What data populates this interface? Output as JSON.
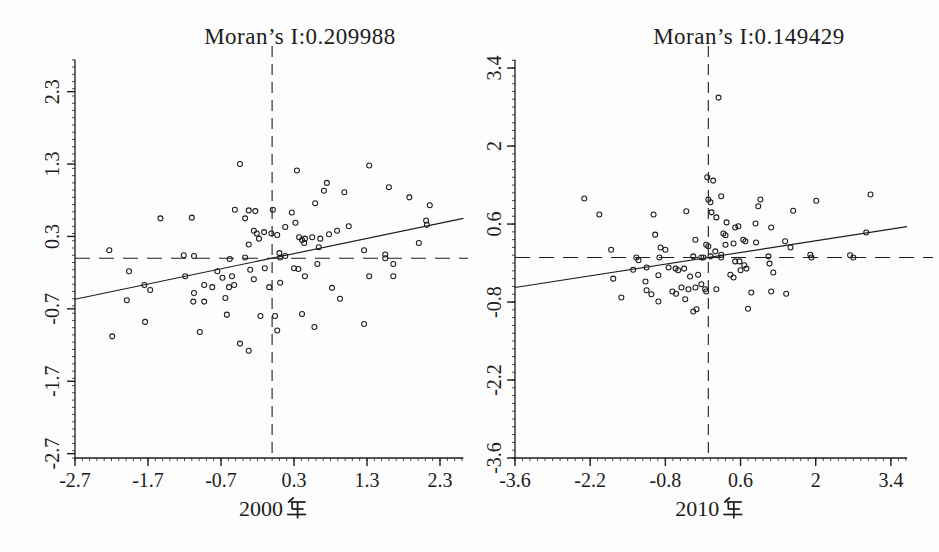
{
  "figure": {
    "background": "#fdfdfd",
    "ink_color": "#1c1c1c"
  },
  "chart_data": [
    {
      "type": "scatter",
      "title": "Moran’s I:0.209988",
      "moran_i": "0.209988",
      "xlabel": "2000年",
      "xlabel_year": "2000",
      "ylabel": "",
      "xlim": [
        -2.7,
        2.62
      ],
      "ylim": [
        -2.76,
        2.74
      ],
      "xticks": [
        -2.7,
        -1.7,
        -0.7,
        0.3,
        1.3,
        2.3
      ],
      "xtick_labels": [
        "-2.7",
        "-1.7",
        "-0.7",
        "0.3",
        "1.3",
        "2.3"
      ],
      "yticks": [
        -2.7,
        -1.7,
        -0.7,
        0.3,
        1.3,
        2.3
      ],
      "ytick_labels": [
        "-2.7",
        "-1.7",
        "-0.7",
        "0.3",
        "1.3",
        "2.3"
      ],
      "grid": false,
      "legend": "none",
      "crosshair": {
        "x": 0,
        "y": 0,
        "style": "dashed"
      },
      "regression": {
        "slope": 0.209988,
        "intercept": 0
      },
      "marker": {
        "shape": "open-circle",
        "radius": 2.5
      },
      "points": [
        [
          -0.44,
          1.3
        ],
        [
          -1.53,
          0.55
        ],
        [
          -1.1,
          0.56
        ],
        [
          -0.51,
          0.67
        ],
        [
          -0.32,
          0.66
        ],
        [
          -0.23,
          0.65
        ],
        [
          -0.37,
          0.55
        ],
        [
          -2.23,
          0.11
        ],
        [
          -1.21,
          0.04
        ],
        [
          -1.07,
          0.03
        ],
        [
          -0.25,
          0.38
        ],
        [
          -0.21,
          0.34
        ],
        [
          -0.18,
          0.27
        ],
        [
          -0.11,
          0.36
        ],
        [
          -0.01,
          0.34
        ],
        [
          -0.32,
          0.19
        ],
        [
          0.01,
          0.67
        ],
        [
          0.34,
          1.21
        ],
        [
          1.33,
          1.28
        ],
        [
          0.75,
          1.04
        ],
        [
          0.71,
          0.93
        ],
        [
          1.6,
          0.98
        ],
        [
          1.88,
          0.84
        ],
        [
          0.99,
          0.91
        ],
        [
          0.59,
          0.76
        ],
        [
          2.16,
          0.73
        ],
        [
          0.27,
          0.63
        ],
        [
          0.32,
          0.49
        ],
        [
          0.18,
          0.43
        ],
        [
          1.05,
          0.44
        ],
        [
          2.11,
          0.52
        ],
        [
          2.12,
          0.46
        ],
        [
          0.07,
          0.32
        ],
        [
          0.37,
          0.29
        ],
        [
          0.41,
          0.25
        ],
        [
          0.45,
          0.27
        ],
        [
          0.55,
          0.29
        ],
        [
          0.78,
          0.33
        ],
        [
          0.89,
          0.38
        ],
        [
          0.66,
          0.27
        ],
        [
          0.44,
          0.21
        ],
        [
          0.64,
          0.15
        ],
        [
          1.26,
          0.11
        ],
        [
          1.55,
          0.05
        ],
        [
          2.01,
          0.21
        ],
        [
          0.1,
          0.07
        ],
        [
          -1.96,
          -0.18
        ],
        [
          -1.75,
          -0.37
        ],
        [
          -1.67,
          -0.44
        ],
        [
          -1.99,
          -0.58
        ],
        [
          -1.19,
          -0.25
        ],
        [
          -1.07,
          -0.48
        ],
        [
          -0.93,
          -0.37
        ],
        [
          -1.08,
          -0.6
        ],
        [
          -0.93,
          -0.6
        ],
        [
          -0.82,
          -0.4
        ],
        [
          -0.75,
          -0.18
        ],
        [
          -0.68,
          -0.27
        ],
        [
          -0.64,
          -0.55
        ],
        [
          -0.59,
          -0.4
        ],
        [
          -0.55,
          -0.25
        ],
        [
          -0.52,
          -0.37
        ],
        [
          -0.3,
          -0.16
        ],
        [
          -0.25,
          -0.29
        ],
        [
          -0.1,
          -0.14
        ],
        [
          -0.04,
          -0.4
        ],
        [
          -0.62,
          -0.78
        ],
        [
          -0.16,
          -0.8
        ],
        [
          -1.74,
          -0.88
        ],
        [
          -0.99,
          -1.02
        ],
        [
          -2.19,
          -1.08
        ],
        [
          -0.44,
          -1.18
        ],
        [
          -0.32,
          -1.28
        ],
        [
          -0.58,
          -0.01
        ],
        [
          -0.37,
          0.01
        ],
        [
          0.3,
          -0.14
        ],
        [
          0.36,
          -0.15
        ],
        [
          0.45,
          -0.25
        ],
        [
          0.11,
          -0.34
        ],
        [
          0.62,
          -0.08
        ],
        [
          1.55,
          0.0
        ],
        [
          1.66,
          -0.08
        ],
        [
          1.66,
          -0.25
        ],
        [
          1.33,
          -0.25
        ],
        [
          0.82,
          -0.41
        ],
        [
          0.93,
          -0.56
        ],
        [
          0.04,
          -0.8
        ],
        [
          0.41,
          -0.77
        ],
        [
          0.58,
          -0.95
        ],
        [
          0.07,
          -1.0
        ],
        [
          1.26,
          -0.91
        ],
        [
          0.11,
          0.01
        ],
        [
          0.18,
          0.03
        ]
      ]
    },
    {
      "type": "scatter",
      "title": "Moran’s I:0.149429",
      "moran_i": "0.149429",
      "xlabel": "2010年",
      "xlabel_year": "2010",
      "ylabel": "",
      "xlim": [
        -3.6,
        3.7
      ],
      "ylim": [
        -3.6,
        3.55
      ],
      "xticks": [
        -3.6,
        -2.2,
        -0.8,
        0.6,
        2,
        3.4
      ],
      "xtick_labels": [
        "-3.6",
        "-2.2",
        "-0.8",
        "0.6",
        "2",
        "3.4"
      ],
      "yticks": [
        -3.6,
        -2.2,
        -0.8,
        0.6,
        2,
        3.4
      ],
      "ytick_labels": [
        "-3.6",
        "-2.2",
        "-0.8",
        "0.6",
        "2",
        "3.4"
      ],
      "grid": false,
      "legend": "none",
      "crosshair": {
        "x": 0,
        "y": 0,
        "style": "dashed"
      },
      "regression": {
        "slope": 0.149429,
        "intercept": 0
      },
      "marker": {
        "shape": "open-circle",
        "radius": 2.5
      },
      "points": [
        [
          -2.31,
          1.06
        ],
        [
          -2.03,
          0.77
        ],
        [
          -1.02,
          0.77
        ],
        [
          -0.41,
          0.83
        ],
        [
          0.0,
          1.04
        ],
        [
          -0.99,
          0.41
        ],
        [
          -1.81,
          0.14
        ],
        [
          -0.89,
          0.18
        ],
        [
          -0.8,
          0.14
        ],
        [
          -0.24,
          0.32
        ],
        [
          -0.04,
          0.23
        ],
        [
          0.04,
          0.99
        ],
        [
          -0.02,
          1.44
        ],
        [
          0.19,
          2.87
        ],
        [
          0.09,
          1.38
        ],
        [
          0.24,
          1.1
        ],
        [
          0.97,
          1.04
        ],
        [
          0.93,
          0.92
        ],
        [
          2.01,
          1.02
        ],
        [
          3.02,
          1.13
        ],
        [
          1.58,
          0.84
        ],
        [
          0.06,
          0.81
        ],
        [
          0.15,
          0.72
        ],
        [
          0.34,
          0.63
        ],
        [
          0.5,
          0.54
        ],
        [
          0.56,
          0.56
        ],
        [
          0.88,
          0.61
        ],
        [
          1.17,
          0.54
        ],
        [
          0.28,
          0.43
        ],
        [
          0.32,
          0.4
        ],
        [
          0.65,
          0.32
        ],
        [
          0.69,
          0.29
        ],
        [
          0.32,
          0.23
        ],
        [
          0.47,
          0.25
        ],
        [
          0.89,
          0.27
        ],
        [
          1.43,
          0.29
        ],
        [
          1.53,
          0.18
        ],
        [
          2.94,
          0.45
        ],
        [
          1.9,
          0.05
        ],
        [
          2.64,
          0.04
        ],
        [
          0.0,
          0.2
        ],
        [
          0.13,
          0.11
        ],
        [
          0.24,
          0.05
        ],
        [
          -1.77,
          -0.38
        ],
        [
          -1.4,
          -0.22
        ],
        [
          -1.3,
          -0.05
        ],
        [
          -1.15,
          -0.18
        ],
        [
          -1.17,
          -0.43
        ],
        [
          -1.62,
          -0.72
        ],
        [
          -1.15,
          -0.59
        ],
        [
          -1.06,
          -0.66
        ],
        [
          -0.93,
          -0.32
        ],
        [
          -0.93,
          -0.79
        ],
        [
          -0.74,
          -0.18
        ],
        [
          -0.61,
          -0.2
        ],
        [
          -0.56,
          -0.23
        ],
        [
          -0.67,
          -0.61
        ],
        [
          -0.6,
          -0.65
        ],
        [
          -0.5,
          -0.54
        ],
        [
          -0.45,
          -0.2
        ],
        [
          -0.37,
          -0.57
        ],
        [
          -0.34,
          -0.34
        ],
        [
          -0.24,
          -0.54
        ],
        [
          -0.19,
          -0.31
        ],
        [
          -0.13,
          -0.48
        ],
        [
          -0.22,
          -0.93
        ],
        [
          -0.28,
          -0.97
        ],
        [
          -0.43,
          -0.75
        ],
        [
          -0.06,
          -0.57
        ],
        [
          -0.04,
          -0.61
        ],
        [
          -1.34,
          0.0
        ],
        [
          -0.91,
          0.0
        ],
        [
          -0.28,
          0.02
        ],
        [
          -0.13,
          0.0
        ],
        [
          -0.09,
          0.0
        ],
        [
          0.04,
          0.02
        ],
        [
          0.24,
          0.0
        ],
        [
          0.5,
          -0.07
        ],
        [
          0.58,
          -0.07
        ],
        [
          0.67,
          -0.14
        ],
        [
          0.71,
          -0.2
        ],
        [
          0.6,
          -0.23
        ],
        [
          0.41,
          -0.31
        ],
        [
          0.47,
          -0.36
        ],
        [
          1.14,
          -0.11
        ],
        [
          1.12,
          0.02
        ],
        [
          1.21,
          -0.27
        ],
        [
          0.15,
          -0.57
        ],
        [
          0.8,
          -0.63
        ],
        [
          1.17,
          -0.61
        ],
        [
          1.45,
          -0.65
        ],
        [
          0.74,
          -0.92
        ],
        [
          1.92,
          0.0
        ],
        [
          2.7,
          0.0
        ]
      ]
    }
  ]
}
